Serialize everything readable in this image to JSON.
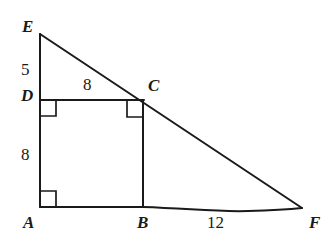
{
  "figure": {
    "type": "geometry-diagram",
    "background_color": "#ffffff",
    "stroke_color": "#1a1a1a",
    "text_color": "#1a1a1a",
    "vertex_labels": [
      {
        "id": "E",
        "text": "E",
        "x": 22,
        "y": 18,
        "style": "italic"
      },
      {
        "id": "D",
        "text": "D",
        "x": 21,
        "y": 87,
        "style": "italic"
      },
      {
        "id": "C",
        "text": "C",
        "x": 148,
        "y": 77,
        "style": "italic"
      },
      {
        "id": "A",
        "text": "A",
        "x": 23,
        "y": 214,
        "style": "italic"
      },
      {
        "id": "B",
        "text": "B",
        "x": 137,
        "y": 214,
        "style": "italic"
      },
      {
        "id": "F",
        "text": "F",
        "x": 309,
        "y": 214,
        "style": "italic"
      }
    ],
    "measure_labels": [
      {
        "id": "ED",
        "text": "5",
        "x": 21,
        "y": 61,
        "segment": "E to D"
      },
      {
        "id": "DC",
        "text": "8",
        "x": 83,
        "y": 76,
        "segment": "D to C"
      },
      {
        "id": "DA",
        "text": "8",
        "x": 21,
        "y": 146,
        "segment": "D to A"
      },
      {
        "id": "BF",
        "text": "12",
        "x": 207,
        "y": 214,
        "segment": "B to F"
      }
    ],
    "points": {
      "E": {
        "x": 40,
        "y": 34
      },
      "D": {
        "x": 40,
        "y": 100
      },
      "A": {
        "x": 40,
        "y": 207
      },
      "B": {
        "x": 143,
        "y": 207
      },
      "C": {
        "x": 143,
        "y": 100
      },
      "F": {
        "x": 302,
        "y": 208
      }
    },
    "segments": [
      {
        "id": "EA",
        "from": "E",
        "to": "A",
        "note": "left vertical leg through D"
      },
      {
        "id": "EF",
        "from": "E",
        "to": "F",
        "note": "hypotenuse through C"
      },
      {
        "id": "AF",
        "from": "A",
        "to": "F",
        "note": "base, hand-drawn wobble"
      },
      {
        "id": "DC",
        "from": "D",
        "to": "C",
        "note": "top of rectangle"
      },
      {
        "id": "CB",
        "from": "C",
        "to": "B",
        "note": "right side of rectangle"
      }
    ],
    "right_angles": [
      {
        "id": "angle-D",
        "at": "D",
        "x": 40,
        "y": 100,
        "size": 16,
        "dir_x": 1,
        "dir_y": 1
      },
      {
        "id": "angle-C",
        "at": "C",
        "x": 143,
        "y": 101,
        "size": 16,
        "dir_x": -1,
        "dir_y": 1
      },
      {
        "id": "angle-A",
        "at": "A",
        "x": 40,
        "y": 207,
        "size": 16,
        "dir_x": 1,
        "dir_y": -1
      }
    ]
  }
}
